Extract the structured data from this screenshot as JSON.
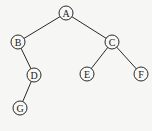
{
  "diagram": {
    "type": "binary-tree",
    "nodes": [
      {
        "id": "A",
        "label": "A",
        "x": 66,
        "y": 13
      },
      {
        "id": "B",
        "label": "B",
        "x": 18,
        "y": 42
      },
      {
        "id": "C",
        "label": "C",
        "x": 112,
        "y": 42
      },
      {
        "id": "D",
        "label": "D",
        "x": 34,
        "y": 75
      },
      {
        "id": "E",
        "label": "E",
        "x": 87,
        "y": 74
      },
      {
        "id": "F",
        "label": "F",
        "x": 141,
        "y": 74
      },
      {
        "id": "G",
        "label": "G",
        "x": 20,
        "y": 108
      }
    ],
    "edges": [
      {
        "from": "A",
        "to": "B"
      },
      {
        "from": "A",
        "to": "C"
      },
      {
        "from": "B",
        "to": "D"
      },
      {
        "from": "C",
        "to": "E"
      },
      {
        "from": "C",
        "to": "F"
      },
      {
        "from": "D",
        "to": "G"
      }
    ],
    "node_radius": 7
  }
}
